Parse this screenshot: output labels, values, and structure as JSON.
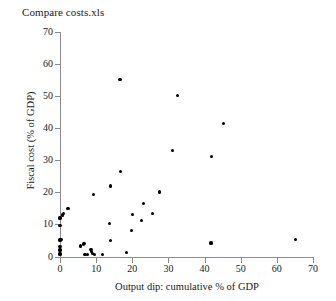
{
  "chart_data": {
    "type": "scatter",
    "title": "Compare costs.xls",
    "xlabel": "Output dip: cumulative % of GDP",
    "ylabel": "Fiscal cost (% of GDP)",
    "xlim": [
      0,
      70
    ],
    "ylim": [
      0,
      70
    ],
    "xticks": [
      0,
      10,
      20,
      30,
      40,
      50,
      60,
      70
    ],
    "yticks": [
      0,
      10,
      20,
      30,
      40,
      50,
      60,
      70
    ],
    "grid": false,
    "legend": null,
    "marker": "filled-circle",
    "marker_color": "#000000",
    "points": [
      {
        "x": 0.0,
        "y": 0.5
      },
      {
        "x": 0.0,
        "y": 1.0
      },
      {
        "x": 0.0,
        "y": 2.0
      },
      {
        "x": 0.0,
        "y": 3.0
      },
      {
        "x": 0.0,
        "y": 5.0
      },
      {
        "x": 0.0,
        "y": 5.3
      },
      {
        "x": 0.0,
        "y": 9.6
      },
      {
        "x": 0.0,
        "y": 12.0
      },
      {
        "x": 0.3,
        "y": 5.3
      },
      {
        "x": 0.6,
        "y": 13.0
      },
      {
        "x": 0.8,
        "y": 12.8
      },
      {
        "x": 1.0,
        "y": 13.3
      },
      {
        "x": 2.2,
        "y": 14.9
      },
      {
        "x": 5.6,
        "y": 3.3
      },
      {
        "x": 6.6,
        "y": 3.9
      },
      {
        "x": 6.8,
        "y": 4.0
      },
      {
        "x": 6.9,
        "y": 0.7
      },
      {
        "x": 7.5,
        "y": 0.7
      },
      {
        "x": 8.6,
        "y": 2.2
      },
      {
        "x": 8.8,
        "y": 1.5
      },
      {
        "x": 9.0,
        "y": 0.9
      },
      {
        "x": 9.3,
        "y": 19.4
      },
      {
        "x": 9.5,
        "y": 0.6
      },
      {
        "x": 11.8,
        "y": 0.7
      },
      {
        "x": 13.8,
        "y": 10.3
      },
      {
        "x": 13.9,
        "y": 22.0
      },
      {
        "x": 14.0,
        "y": 5.0
      },
      {
        "x": 16.6,
        "y": 55.1
      },
      {
        "x": 16.8,
        "y": 26.6
      },
      {
        "x": 18.5,
        "y": 1.2
      },
      {
        "x": 19.7,
        "y": 8.1
      },
      {
        "x": 20.0,
        "y": 13.1
      },
      {
        "x": 22.6,
        "y": 11.3
      },
      {
        "x": 23.0,
        "y": 16.5
      },
      {
        "x": 25.5,
        "y": 13.4
      },
      {
        "x": 27.5,
        "y": 20.1
      },
      {
        "x": 31.2,
        "y": 33.0
      },
      {
        "x": 32.6,
        "y": 50.2
      },
      {
        "x": 41.8,
        "y": 4.2
      },
      {
        "x": 42.0,
        "y": 31.3
      },
      {
        "x": 45.3,
        "y": 41.5
      },
      {
        "x": 65.2,
        "y": 5.4
      }
    ]
  }
}
